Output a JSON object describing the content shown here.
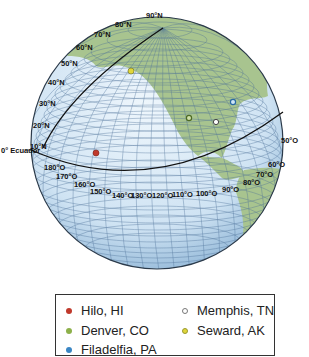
{
  "figure": {
    "type": "globe-diagram",
    "equator_label": "0° Ecuador",
    "latitude_labels": [
      "10°N",
      "20°N",
      "30°N",
      "40°N",
      "50°N",
      "60°N",
      "70°N",
      "80°N",
      "90°N"
    ],
    "longitude_labels": [
      "180°O",
      "170°O",
      "160°O",
      "150°O",
      "140°O",
      "130°O",
      "120°O",
      "110°O",
      "100°O",
      "90°O",
      "80°O",
      "70°O",
      "60°O",
      "50°O"
    ],
    "colors": {
      "ocean": "#d6e8f5",
      "ocean_edge": "#8fb5d6",
      "land": "#a9c48f",
      "grid": "#4a6e96",
      "outline": "#2b3a4a",
      "meridian_line": "#111111"
    },
    "points": [
      {
        "name": "Hilo, HI",
        "color": "#c0392b",
        "x": 96,
        "y": 153,
        "filled": true
      },
      {
        "name": "Denver, CO",
        "color": "#8db04a",
        "x": 189,
        "y": 118,
        "filled": false
      },
      {
        "name": "Filadelfia, PA",
        "color": "#3a86c4",
        "x": 233,
        "y": 102,
        "filled": false
      },
      {
        "name": "Memphis, TN",
        "color": "#ffffff",
        "x": 216,
        "y": 122,
        "filled": false
      },
      {
        "name": "Seward, AK",
        "color": "#e0d63a",
        "x": 131,
        "y": 71,
        "filled": true
      }
    ]
  },
  "legend": {
    "items": [
      {
        "label": "Hilo, HI",
        "color": "#c0392b",
        "border": "#c0392b"
      },
      {
        "label": "Denver, CO",
        "color": "#8db04a",
        "border": "#8db04a"
      },
      {
        "label": "Filadelfia, PA",
        "color": "#3a86c4",
        "border": "#3a86c4"
      },
      {
        "label": "Memphis, TN",
        "color": "#ffffff",
        "border": "#777777"
      },
      {
        "label": "Seward, AK",
        "color": "#e0d63a",
        "border": "#9a9a30"
      }
    ]
  }
}
